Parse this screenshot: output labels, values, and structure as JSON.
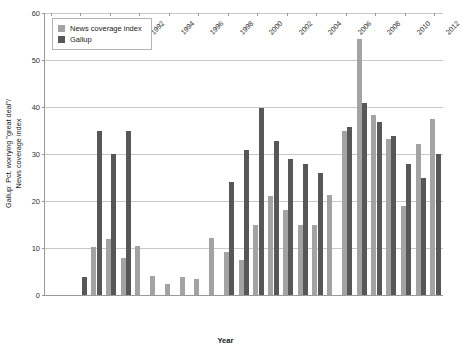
{
  "chart_data": {
    "type": "bar",
    "title": "",
    "xlabel": "Year",
    "ylabel": "Gallup: Pct. worrying \"great deal\"/\nNews coverage index",
    "ylim": [
      0,
      60
    ],
    "yticks": [
      0,
      10,
      20,
      30,
      40,
      50,
      60
    ],
    "grid": true,
    "legend_position": "top-left",
    "xtick_labels": [
      "1986",
      "1988",
      "1990",
      "1992",
      "1994",
      "1996",
      "1998",
      "2000",
      "2002",
      "2004",
      "2006",
      "2008",
      "2010",
      "2012"
    ],
    "categories": [
      1986,
      1987,
      1988,
      1989,
      1990,
      1991,
      1992,
      1993,
      1994,
      1995,
      1996,
      1997,
      1998,
      1999,
      2000,
      2001,
      2002,
      2003,
      2004,
      2005,
      2006,
      2007,
      2008,
      2009,
      2010,
      2011,
      2012
    ],
    "series": [
      {
        "name": "News coverage index",
        "color": "#a3a3a3",
        "values": [
          0,
          0,
          0,
          10.3,
          12.0,
          7.8,
          10.4,
          4.1,
          2.4,
          3.9,
          3.5,
          12.2,
          9.2,
          7.5,
          15.0,
          21.0,
          18.1,
          14.9,
          15.0,
          21.2,
          34.8,
          54.5,
          38.3,
          33.1,
          19.0,
          32.2,
          37.5
        ]
      },
      {
        "name": "Gallup",
        "color": "#575757",
        "values": [
          0,
          0,
          3.9,
          34.9,
          30.0,
          34.9,
          0,
          0,
          0,
          0,
          0,
          0,
          24.0,
          30.9,
          39.8,
          32.8,
          28.9,
          27.9,
          26.0,
          0,
          35.8,
          40.8,
          36.8,
          33.9,
          27.9,
          24.9,
          30.0
        ]
      }
    ]
  },
  "legend": {
    "items": [
      {
        "label": "News coverage index",
        "color": "#a3a3a3"
      },
      {
        "label": "Gallup",
        "color": "#575757"
      }
    ]
  }
}
